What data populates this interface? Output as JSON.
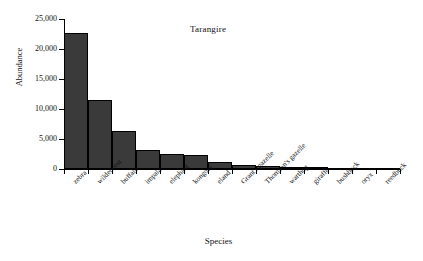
{
  "chart_data": {
    "type": "bar",
    "title": "Tarangire",
    "xlabel": "Species",
    "ylabel": "Abundance",
    "categories": [
      "zebra",
      "wildebeest",
      "buffalo",
      "impala",
      "elephant",
      "kongoni",
      "eland",
      "Grant's gazelle",
      "Thomson's gazelle",
      "warthog",
      "giraffe",
      "bushbuck",
      "oryx",
      "reedbuck"
    ],
    "values": [
      22600,
      11500,
      6300,
      3100,
      2500,
      2300,
      1200,
      700,
      500,
      350,
      350,
      150,
      100,
      50
    ],
    "ylim": [
      0,
      25000
    ],
    "ytick_values": [
      0,
      5000,
      10000,
      15000,
      20000,
      25000
    ],
    "ytick_labels": [
      "0",
      "5,000",
      "10,000",
      "15,000",
      "20,000",
      "25,000"
    ],
    "grid": false,
    "legend": false,
    "bar_color": "#3a3a3a",
    "bar_edge_color": "#000000",
    "axis_color": "#000000",
    "background_color": "#ffffff"
  }
}
